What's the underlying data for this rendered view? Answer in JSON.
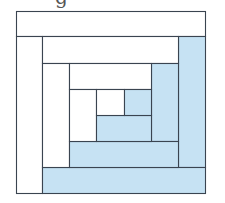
{
  "title_fragment": "g",
  "diagram": {
    "type": "log-cabin-quilt-block",
    "colors": {
      "light": "#ffffff",
      "dark": "#c6e2f3",
      "stroke": "#3a4450"
    },
    "pieces": [
      {
        "id": "top-1",
        "x": 16,
        "y": 11,
        "w": 189,
        "h": 25,
        "fill": "light"
      },
      {
        "id": "left-1",
        "x": 16,
        "y": 36,
        "w": 26,
        "h": 157,
        "fill": "light"
      },
      {
        "id": "right-1",
        "x": 178,
        "y": 36,
        "w": 27,
        "h": 131,
        "fill": "dark"
      },
      {
        "id": "bottom-1",
        "x": 42,
        "y": 167,
        "w": 163,
        "h": 26,
        "fill": "dark"
      },
      {
        "id": "top-2",
        "x": 42,
        "y": 36,
        "w": 136,
        "h": 27,
        "fill": "light"
      },
      {
        "id": "left-2",
        "x": 42,
        "y": 63,
        "w": 27,
        "h": 104,
        "fill": "light"
      },
      {
        "id": "right-2",
        "x": 151,
        "y": 63,
        "w": 27,
        "h": 78,
        "fill": "dark"
      },
      {
        "id": "bottom-2",
        "x": 69,
        "y": 141,
        "w": 109,
        "h": 26,
        "fill": "dark"
      },
      {
        "id": "top-3",
        "x": 69,
        "y": 63,
        "w": 82,
        "h": 26,
        "fill": "light"
      },
      {
        "id": "left-3",
        "x": 69,
        "y": 89,
        "w": 27,
        "h": 52,
        "fill": "light"
      },
      {
        "id": "bottom-3",
        "x": 96,
        "y": 115,
        "w": 55,
        "h": 26,
        "fill": "dark"
      },
      {
        "id": "center-light",
        "x": 96,
        "y": 89,
        "w": 28,
        "h": 26,
        "fill": "light"
      },
      {
        "id": "center-dark",
        "x": 124,
        "y": 89,
        "w": 27,
        "h": 26,
        "fill": "dark"
      }
    ]
  }
}
